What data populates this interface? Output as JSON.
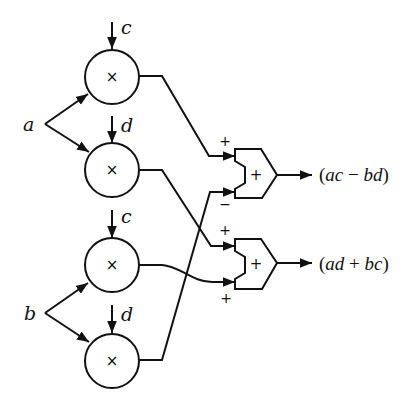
{
  "diagram": {
    "inputs": [
      {
        "id": "a",
        "label": "a"
      },
      {
        "id": "b",
        "label": "b"
      }
    ],
    "multipliers": [
      {
        "id": "m1",
        "symbol": "×",
        "side_input": "c",
        "from": "a"
      },
      {
        "id": "m2",
        "symbol": "×",
        "side_input": "d",
        "from": "a"
      },
      {
        "id": "m3",
        "symbol": "×",
        "side_input": "c",
        "from": "b"
      },
      {
        "id": "m4",
        "symbol": "×",
        "side_input": "d",
        "from": "b"
      }
    ],
    "adders": [
      {
        "id": "add1",
        "symbol": "+",
        "top_sign": "+",
        "bottom_sign": "−",
        "top_from": "m1",
        "bottom_from": "m4",
        "output": {
          "open": "(",
          "t1": "ac",
          "op": " − ",
          "t2": "bd",
          "close": ")"
        }
      },
      {
        "id": "add2",
        "symbol": "+",
        "top_sign": "+",
        "bottom_sign": "+",
        "top_from": "m2",
        "bottom_from": "m3",
        "output": {
          "open": "(",
          "t1": "ad",
          "op": " + ",
          "t2": "bc",
          "close": ")"
        }
      }
    ],
    "outputs": [
      {
        "label": "(ac − bd)"
      },
      {
        "label": "(ad + bc)"
      }
    ],
    "colors": {
      "stroke": "#111111",
      "background": "#ffffff"
    }
  }
}
